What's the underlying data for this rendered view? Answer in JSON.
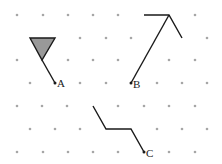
{
  "diagram": {
    "type": "isometric-dot-grid",
    "colors": {
      "dot": "#a6a6a6",
      "line": "#1a1a1a",
      "fill": "#999999"
    },
    "dot_rows": [
      {
        "y": 15,
        "xs": [
          17,
          43,
          68,
          93,
          118,
          195
        ]
      },
      {
        "y": 38,
        "xs": [
          80,
          106,
          131,
          207
        ]
      },
      {
        "y": 60,
        "xs": [
          17,
          68,
          93,
          118,
          169,
          195
        ]
      },
      {
        "y": 83,
        "xs": [
          30,
          80,
          106,
          157,
          182,
          207
        ]
      },
      {
        "y": 106,
        "xs": [
          17,
          42,
          67,
          118,
          144,
          169,
          195
        ]
      },
      {
        "y": 129,
        "xs": [
          30,
          55,
          80,
          157,
          182,
          207
        ]
      },
      {
        "y": 152,
        "xs": [
          17,
          43,
          68,
          93,
          118,
          169,
          195
        ]
      }
    ],
    "figures": [
      {
        "name": "A",
        "label": "A",
        "triangle": [
          [
            30,
            38
          ],
          [
            55,
            38
          ],
          [
            42,
            60
          ]
        ],
        "path": [
          [
            42,
            60
          ],
          [
            55,
            83
          ]
        ],
        "endpoint": [
          55,
          83
        ],
        "label_pos": [
          57,
          87
        ]
      },
      {
        "name": "B",
        "label": "B",
        "path": [
          [
            144,
            15
          ],
          [
            169,
            15
          ],
          [
            182,
            38
          ]
        ],
        "path2": [
          [
            169,
            15
          ],
          [
            131,
            83
          ]
        ],
        "endpoint": [
          131,
          83
        ],
        "label_pos": [
          133,
          88
        ]
      },
      {
        "name": "C",
        "label": "C",
        "path": [
          [
            93,
            106
          ],
          [
            106,
            129
          ],
          [
            131,
            129
          ],
          [
            144,
            152
          ]
        ],
        "endpoint": [
          144,
          152
        ],
        "label_pos": [
          146,
          157
        ]
      }
    ]
  }
}
